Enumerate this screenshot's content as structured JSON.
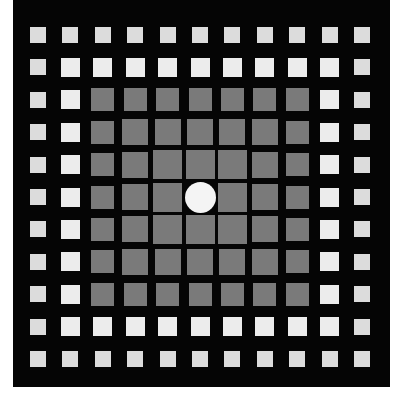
{
  "figure": {
    "grid_size": 11,
    "center_x": 200,
    "center_y": 197,
    "pitch": 32.4,
    "colors": {
      "background": "#050505",
      "page": "#ffffff",
      "ring_colors": [
        "#dcdcdc",
        "#ececec",
        "#7a7a7a",
        "#7a7a7a",
        "#7a7a7a"
      ],
      "center_circle": "#f4f4f4"
    },
    "ring_square_sizes": [
      16,
      19,
      23,
      26,
      29
    ],
    "center_circle_diameter": 31
  }
}
